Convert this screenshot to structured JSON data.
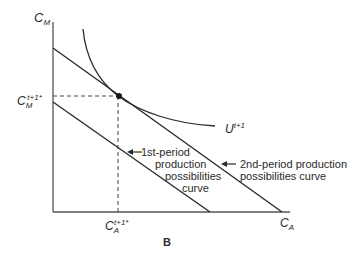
{
  "figure": {
    "panel_label": "B",
    "axes": {
      "y_label_main": "C",
      "y_label_sub": "M",
      "x_label_main": "C",
      "x_label_sub": "A"
    },
    "optimum": {
      "y_tick_main": "C",
      "y_tick_sub": "M",
      "y_tick_sup": "t+1*",
      "x_tick_main": "C",
      "x_tick_sub": "A",
      "x_tick_sup": "t+1*"
    },
    "indifference_curve": {
      "main": "U",
      "sup": "t+1"
    },
    "first_period_label": {
      "arrow": "←",
      "line1": "1st-period",
      "line2": "production",
      "line3": "possibilities",
      "line4": "curve"
    },
    "second_period_label": {
      "arrow": "←",
      "line1": "2nd-period production",
      "line2": "possibilities curve"
    },
    "colors": {
      "line": "#2a2a2a",
      "background": "#ffffff"
    }
  }
}
